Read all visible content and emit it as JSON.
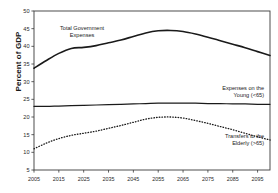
{
  "chart_data": {
    "type": "line",
    "title": "",
    "xlabel": "",
    "ylabel": "Percent of GDP",
    "xlim": [
      2005,
      2100
    ],
    "ylim": [
      5,
      50
    ],
    "grid": false,
    "legend_position": "inline-annotations",
    "xticks": [
      "2005",
      "2015",
      "2025",
      "2035",
      "2045",
      "2055",
      "2065",
      "2075",
      "2085",
      "2095"
    ],
    "yticks": [
      "5",
      "10",
      "15",
      "20",
      "25",
      "30",
      "35",
      "40",
      "45",
      "50"
    ],
    "x": [
      2005,
      2010,
      2015,
      2020,
      2025,
      2030,
      2035,
      2040,
      2045,
      2050,
      2055,
      2060,
      2065,
      2070,
      2075,
      2080,
      2085,
      2090,
      2095,
      2100
    ],
    "series": [
      {
        "name": "Total Government Expenses",
        "style": "solid",
        "width": 1.6,
        "color": "#1a1a1a",
        "values": [
          33.8,
          36.0,
          38.0,
          39.4,
          39.7,
          40.2,
          41.0,
          41.8,
          42.8,
          43.8,
          44.4,
          44.5,
          44.2,
          43.5,
          42.6,
          41.6,
          40.6,
          39.6,
          38.5,
          37.4
        ]
      },
      {
        "name": "Expenses on the Young (<65)",
        "style": "solid",
        "width": 1.2,
        "color": "#1a1a1a",
        "values": [
          23.0,
          23.0,
          23.1,
          23.2,
          23.3,
          23.4,
          23.5,
          23.6,
          23.7,
          23.8,
          23.9,
          23.9,
          23.9,
          23.9,
          23.8,
          23.8,
          23.7,
          23.7,
          23.6,
          23.6
        ]
      },
      {
        "name": "Transfers to the Elderly (>65)",
        "style": "dotted",
        "width": 1.3,
        "color": "#1a1a1a",
        "values": [
          11.0,
          12.6,
          13.9,
          14.8,
          15.4,
          16.0,
          16.8,
          17.6,
          18.5,
          19.4,
          19.9,
          20.0,
          19.7,
          19.0,
          18.2,
          17.3,
          16.4,
          15.4,
          14.4,
          13.5
        ]
      }
    ],
    "annotations": [
      {
        "id": "total-government-expenses",
        "line1": "Total Government",
        "line2": "Expenses"
      },
      {
        "id": "expenses-young",
        "line1": "Expenses on the",
        "line2": "Young (<65)"
      },
      {
        "id": "transfers-elderly",
        "line1": "Transfers to the",
        "line2": "Elderly (>65)"
      }
    ]
  },
  "axis": {
    "y_title": "Percent of GDP"
  }
}
